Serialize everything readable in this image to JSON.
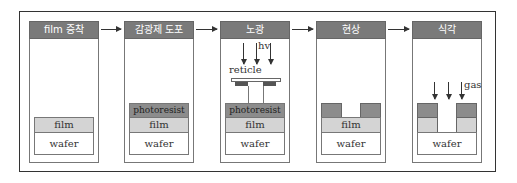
{
  "steps": [
    {
      "title": "film 증착",
      "layers": [
        "film",
        "wafer"
      ]
    },
    {
      "title": "감광제 도포",
      "layers": [
        "photoresist",
        "film",
        "wafer"
      ]
    },
    {
      "title": "노광",
      "layers": [
        "photoresist",
        "film",
        "wafer"
      ],
      "light_label": "hv",
      "mask_label": "reticle"
    },
    {
      "title": "현상",
      "layers": [
        "film",
        "wafer"
      ]
    },
    {
      "title": "식각",
      "layers": [
        "wafer"
      ],
      "gas_label": "gas"
    }
  ],
  "colors": {
    "header": "#7a7a7a",
    "photoresist": "#8c8c8c",
    "film": "#d4d4d4",
    "wafer": "#ffffff"
  }
}
